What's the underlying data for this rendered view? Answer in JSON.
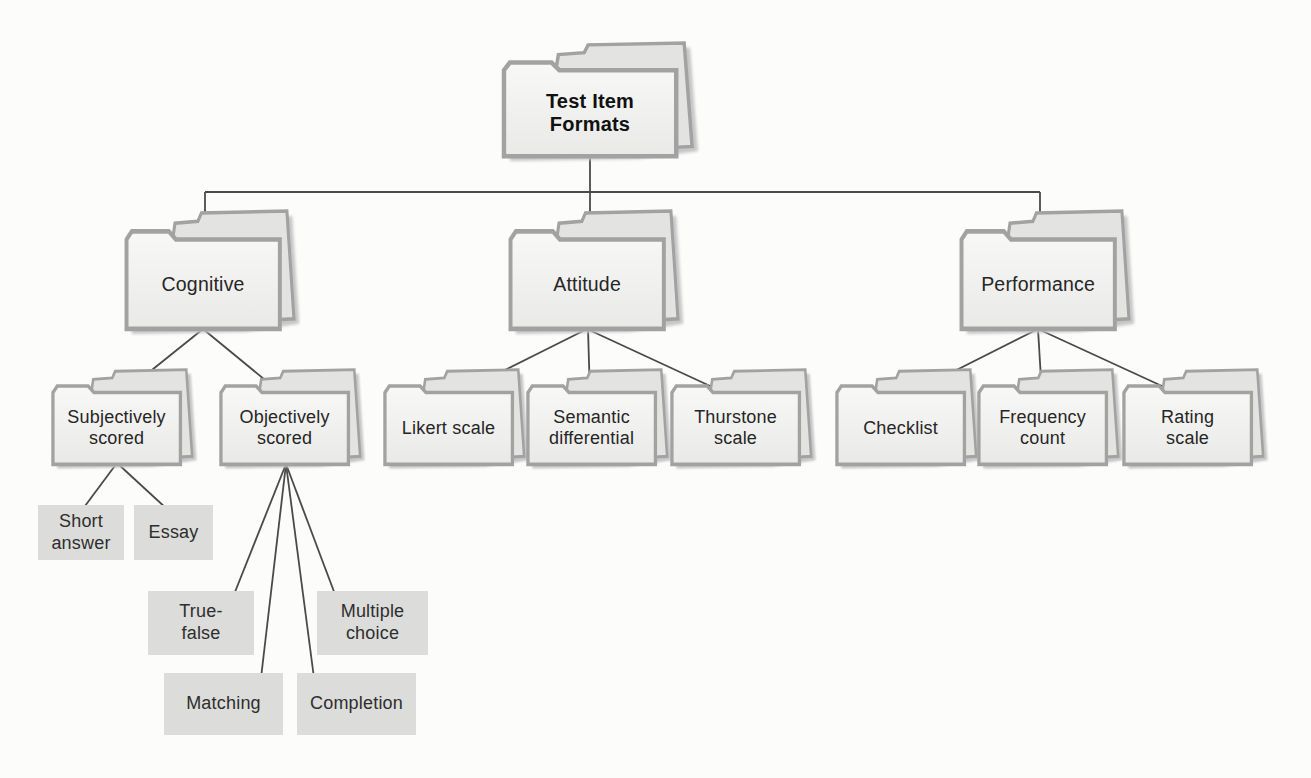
{
  "figure": {
    "title": "Test Item Formats",
    "type": "hierarchy-tree-of-folders",
    "colors": {
      "background": "#fcfcfb",
      "folder_border": "#a2a2a2",
      "folder_fill_top": "#f8f8f6",
      "folder_fill_bottom": "#e9e9e7",
      "folder_back_flap": "#e3e3e1",
      "folder_shadow": "#c6c6c6",
      "leaf_box_fill": "#dcdcda",
      "connector_line": "#4a4a4a",
      "text": "#262626"
    },
    "nodes": {
      "root": {
        "label": "Test Item\nFormats",
        "style": "folder-bold"
      },
      "cognitive": {
        "label": "Cognitive",
        "style": "folder"
      },
      "attitude": {
        "label": "Attitude",
        "style": "folder"
      },
      "performance": {
        "label": "Performance",
        "style": "folder"
      },
      "subjectively_scored": {
        "label": "Subjectively\nscored",
        "style": "folder"
      },
      "objectively_scored": {
        "label": "Objectively\nscored",
        "style": "folder"
      },
      "likert_scale": {
        "label": "Likert scale",
        "style": "folder"
      },
      "semantic_differential": {
        "label": "Semantic\ndifferential",
        "style": "folder"
      },
      "thurstone_scale": {
        "label": "Thurstone\nscale",
        "style": "folder"
      },
      "checklist": {
        "label": "Checklist",
        "style": "folder"
      },
      "frequency_count": {
        "label": "Frequency\ncount",
        "style": "folder"
      },
      "rating_scale": {
        "label": "Rating\nscale",
        "style": "folder"
      },
      "short_answer": {
        "label": "Short\nanswer",
        "style": "gray-box"
      },
      "essay": {
        "label": "Essay",
        "style": "gray-box"
      },
      "true_false": {
        "label": "True-\nfalse",
        "style": "gray-box"
      },
      "multiple_choice": {
        "label": "Multiple\nchoice",
        "style": "gray-box"
      },
      "matching": {
        "label": "Matching",
        "style": "gray-box"
      },
      "completion": {
        "label": "Completion",
        "style": "gray-box"
      }
    },
    "tree": {
      "Test Item Formats": {
        "Cognitive": {
          "Subjectively scored": [
            "Short answer",
            "Essay"
          ],
          "Objectively scored": [
            "True-false",
            "Matching",
            "Completion",
            "Multiple choice"
          ]
        },
        "Attitude": [
          "Likert scale",
          "Semantic differential",
          "Thurstone scale"
        ],
        "Performance": [
          "Checklist",
          "Frequency count",
          "Rating scale"
        ]
      }
    }
  }
}
